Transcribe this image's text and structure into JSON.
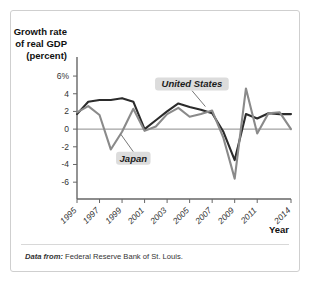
{
  "figure": {
    "y_axis_title_lines": [
      "Growth rate",
      "of real GDP",
      "(percent)"
    ],
    "x_axis_name": "Year",
    "source_lead": "Data from:",
    "source_text": "Federal Reserve Bank of St. Louis."
  },
  "colors": {
    "united_states": "#2b2b2b",
    "japan": "#8a8a8a",
    "axis": "#555555",
    "zero_line": "#8c8c8c",
    "label_chip": "#dcdcdc",
    "frame": "#cfcfcf"
  },
  "chart_data": {
    "type": "line",
    "title": "",
    "xlabel": "Year",
    "ylabel": "Growth rate of real GDP (percent)",
    "ylim": [
      -7,
      6.8
    ],
    "xlim": [
      1995,
      2014
    ],
    "grid": false,
    "zero_line": true,
    "legend_position": "inline-annotations",
    "ytick_labels": [
      "6%",
      "4",
      "2",
      "0",
      "-2",
      "-4",
      "-6"
    ],
    "ytick_values": [
      6,
      4,
      2,
      0,
      -2,
      -4,
      -6
    ],
    "xtick_labels": [
      "1995",
      "1997",
      "1999",
      "2001",
      "2003",
      "2005",
      "2007",
      "2009",
      "2011",
      "2014"
    ],
    "xtick_values": [
      1995,
      1997,
      1999,
      2001,
      2003,
      2005,
      2007,
      2009,
      2011,
      2014
    ],
    "x": [
      1995,
      1996,
      1997,
      1998,
      1999,
      2000,
      2001,
      2002,
      2003,
      2004,
      2005,
      2006,
      2007,
      2008,
      2009,
      2010,
      2011,
      2012,
      2013,
      2014
    ],
    "series": [
      {
        "name": "United States",
        "color": "#2b2b2b",
        "values": [
          1.7,
          3.1,
          3.3,
          3.3,
          3.5,
          3.1,
          0.0,
          1.0,
          2.0,
          2.9,
          2.5,
          2.2,
          1.8,
          -0.3,
          -3.5,
          1.7,
          1.2,
          1.8,
          1.7,
          1.7
        ]
      },
      {
        "name": "Japan",
        "color": "#8a8a8a",
        "values": [
          1.9,
          2.6,
          1.6,
          -2.3,
          -0.3,
          2.3,
          -0.2,
          0.3,
          1.7,
          2.4,
          1.4,
          1.7,
          2.1,
          -1.0,
          -5.6,
          4.6,
          -0.5,
          1.8,
          1.9,
          0.0
        ]
      }
    ],
    "annotations": [
      {
        "label": "United States",
        "x": 2005,
        "y": 5.0
      },
      {
        "label": "Japan",
        "x": 2000,
        "y": -3.2
      }
    ]
  }
}
